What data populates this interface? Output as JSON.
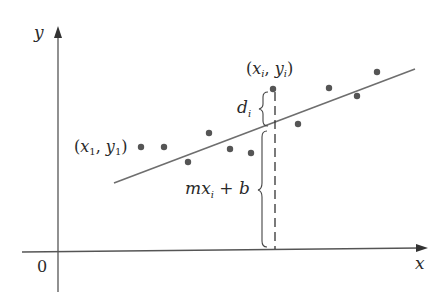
{
  "diagram": {
    "axes": {
      "x_label": "x",
      "y_label": "y",
      "origin_label": "0"
    },
    "labels": {
      "first_point": {
        "open": "(",
        "x": "x",
        "x_sub": "1",
        "comma": ", ",
        "y": "y",
        "y_sub": "1",
        "close": ")"
      },
      "ith_point": {
        "open": "(",
        "x": "x",
        "x_sub": "i",
        "comma": ", ",
        "y": "y",
        "y_sub": "i",
        "close": ")"
      },
      "deviation": {
        "d": "d",
        "sub": "i"
      },
      "line_value": {
        "m": "m",
        "x": "x",
        "sub": "i",
        "rest": " + b"
      }
    },
    "colors": {
      "axis": "#555555",
      "line": "#6e6e6e",
      "points": "#555555",
      "text": "#2a2a2a"
    },
    "points": [
      [
        141,
        147
      ],
      [
        164,
        147
      ],
      [
        188,
        162
      ],
      [
        209,
        133
      ],
      [
        230,
        149
      ],
      [
        251,
        153
      ],
      [
        273,
        89
      ],
      [
        298,
        124
      ],
      [
        329,
        88
      ],
      [
        357,
        96
      ],
      [
        377,
        72
      ]
    ]
  }
}
